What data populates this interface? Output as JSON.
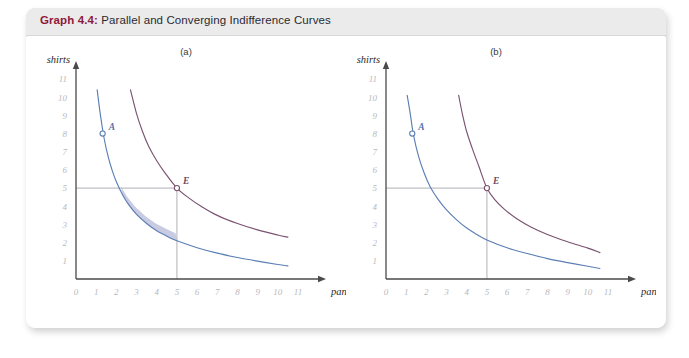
{
  "figure": {
    "label": "Graph 4.4:",
    "title": " Parallel and Converging Indifference Curves"
  },
  "colors": {
    "label_maroon": "#8e1a3c",
    "curve_blue": "#5b7fb4",
    "curve_maroon": "#7a5370",
    "shade": "#9aa0c8",
    "tick_grey": "#b9b9bd",
    "axis_dark": "#3a3a3a",
    "title_bar": "#ebebeb"
  },
  "chart_data": {
    "type": "line",
    "title": "Parallel and Converging Indifference Curves",
    "panels": [
      {
        "key": "a",
        "label": "(a)",
        "xlabel": "pants",
        "ylabel": "shirts",
        "xlim": [
          0,
          11
        ],
        "ylim": [
          0,
          11
        ],
        "xticks": [
          "0",
          "1",
          "2",
          "3",
          "4",
          "5",
          "6",
          "7",
          "8",
          "9",
          "10",
          "11"
        ],
        "yticks": [
          "1",
          "2",
          "3",
          "4",
          "5",
          "6",
          "7",
          "8",
          "9",
          "10",
          "11"
        ],
        "grid": false,
        "series": [
          {
            "name": "lower indifference curve",
            "color": "#5b7fb4",
            "points": [
              [
                1.05,
                10.4
              ],
              [
                1.2,
                9.1
              ],
              [
                1.4,
                7.7
              ],
              [
                1.6,
                6.7
              ],
              [
                1.8,
                5.95
              ],
              [
                2.0,
                5.35
              ],
              [
                2.3,
                4.65
              ],
              [
                2.6,
                4.1
              ],
              [
                3.0,
                3.55
              ],
              [
                3.5,
                3.05
              ],
              [
                4.0,
                2.65
              ],
              [
                4.6,
                2.3
              ],
              [
                5.0,
                2.1
              ],
              [
                6.0,
                1.72
              ],
              [
                7.0,
                1.42
              ],
              [
                8.0,
                1.18
              ],
              [
                9.0,
                0.98
              ],
              [
                10.0,
                0.8
              ],
              [
                10.5,
                0.72
              ]
            ]
          },
          {
            "name": "upper indifference curve",
            "color": "#7a5370",
            "points": [
              [
                2.7,
                10.4
              ],
              [
                3.0,
                9.1
              ],
              [
                3.3,
                8.1
              ],
              [
                3.6,
                7.3
              ],
              [
                4.0,
                6.5
              ],
              [
                4.4,
                5.85
              ],
              [
                5.0,
                5.0
              ],
              [
                5.6,
                4.45
              ],
              [
                6.2,
                4.0
              ],
              [
                7.0,
                3.5
              ],
              [
                8.0,
                3.05
              ],
              [
                9.0,
                2.7
              ],
              [
                10.0,
                2.42
              ],
              [
                10.5,
                2.3
              ]
            ]
          },
          {
            "name": "shaded parallel band",
            "color": "#9aa0c8",
            "note": "thin lens-shaped shaded region drawn between the blue curve and a parallel shifted copy, from about (2.35, 4.85) to (5, 2.1)"
          }
        ],
        "points": [
          {
            "name": "A",
            "label": "A",
            "x": 1.32,
            "y": 8.0,
            "marker": "open-circle",
            "color": "#5b7fb4"
          },
          {
            "name": "E",
            "label": "E",
            "x": 5.0,
            "y": 5.0,
            "marker": "open-circle",
            "color": "#7a5370"
          }
        ],
        "guides": [
          {
            "type": "horizontal",
            "y": 5.0,
            "from_x": 0,
            "to_x": 5.0
          },
          {
            "type": "vertical",
            "x": 5.0,
            "from_y": 0,
            "to_y": 5.0
          }
        ]
      },
      {
        "key": "b",
        "label": "(b)",
        "xlabel": "pants",
        "ylabel": "shirts",
        "xlim": [
          0,
          11
        ],
        "ylim": [
          0,
          11
        ],
        "xticks": [
          "0",
          "1",
          "2",
          "3",
          "4",
          "5",
          "6",
          "7",
          "8",
          "9",
          "10",
          "11"
        ],
        "yticks": [
          "1",
          "2",
          "3",
          "4",
          "5",
          "6",
          "7",
          "8",
          "9",
          "10",
          "11"
        ],
        "grid": false,
        "series": [
          {
            "name": "lower indifference curve",
            "color": "#5b7fb4",
            "points": [
              [
                1.05,
                10.1
              ],
              [
                1.2,
                9.1
              ],
              [
                1.35,
                8.0
              ],
              [
                1.6,
                6.8
              ],
              [
                1.9,
                5.8
              ],
              [
                2.2,
                5.05
              ],
              [
                2.6,
                4.35
              ],
              [
                3.0,
                3.8
              ],
              [
                3.5,
                3.25
              ],
              [
                4.0,
                2.8
              ],
              [
                4.5,
                2.45
              ],
              [
                5.0,
                2.15
              ],
              [
                6.0,
                1.72
              ],
              [
                7.0,
                1.4
              ],
              [
                8.0,
                1.12
              ],
              [
                9.0,
                0.9
              ],
              [
                10.0,
                0.7
              ],
              [
                10.6,
                0.58
              ]
            ]
          },
          {
            "name": "upper indifference curve (converging)",
            "color": "#7a5370",
            "points": [
              [
                3.6,
                10.1
              ],
              [
                3.8,
                9.0
              ],
              [
                4.0,
                8.1
              ],
              [
                4.3,
                7.1
              ],
              [
                4.6,
                6.2
              ],
              [
                5.0,
                5.0
              ],
              [
                5.4,
                4.35
              ],
              [
                5.9,
                3.8
              ],
              [
                6.5,
                3.3
              ],
              [
                7.2,
                2.85
              ],
              [
                8.0,
                2.45
              ],
              [
                9.0,
                2.05
              ],
              [
                10.0,
                1.7
              ],
              [
                10.6,
                1.45
              ]
            ]
          }
        ],
        "points": [
          {
            "name": "A",
            "label": "A",
            "x": 1.3,
            "y": 8.0,
            "marker": "open-circle",
            "color": "#5b7fb4"
          },
          {
            "name": "E",
            "label": "E",
            "x": 5.0,
            "y": 5.0,
            "marker": "open-circle",
            "color": "#7a5370"
          }
        ],
        "guides": [
          {
            "type": "horizontal",
            "y": 5.0,
            "from_x": 0,
            "to_x": 5.0
          },
          {
            "type": "vertical",
            "x": 5.0,
            "from_y": 0,
            "to_y": 5.0
          }
        ]
      }
    ]
  }
}
